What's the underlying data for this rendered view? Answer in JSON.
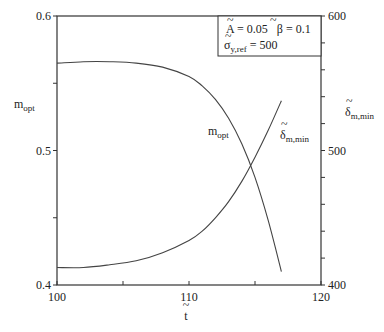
{
  "chart_data": {
    "type": "line",
    "title": "",
    "xlabel": "t̃",
    "ylabel_left": "m_opt",
    "ylabel_right": "δ̃_m,min",
    "xlim": [
      100,
      120
    ],
    "ylim_left": [
      0.4,
      0.6
    ],
    "ylim_right": [
      400,
      600
    ],
    "x_ticks": [
      "100",
      "110",
      "120"
    ],
    "y_ticks_left": [
      "0.4",
      "0.5",
      "0.6"
    ],
    "y_ticks_right": [
      "400",
      "500",
      "600"
    ],
    "grid": false,
    "legend_box": {
      "line1": "Ã = 0.05   β̃ = 0.1",
      "line2": "σ̃_y,ref = 500"
    },
    "series": [
      {
        "name": "m_opt",
        "axis": "left",
        "x": [
          100,
          102,
          104,
          106,
          108,
          110,
          111,
          112,
          113,
          114,
          115,
          116,
          117
        ],
        "values": [
          0.565,
          0.566,
          0.566,
          0.565,
          0.562,
          0.555,
          0.548,
          0.538,
          0.524,
          0.505,
          0.48,
          0.448,
          0.41
        ]
      },
      {
        "name": "δ̃_m,min",
        "axis": "right",
        "x": [
          100,
          102,
          104,
          106,
          108,
          110,
          111,
          112,
          113,
          114,
          115,
          116,
          117
        ],
        "values": [
          413,
          413,
          415,
          418,
          424,
          433,
          440,
          450,
          462,
          477,
          495,
          515,
          537
        ]
      }
    ]
  },
  "labels": {
    "x_axis": "t",
    "y_left_main": "m",
    "y_left_sub": "opt",
    "y_right_main": "δ",
    "y_right_sub": "m,min",
    "curve_mopt_main": "m",
    "curve_mopt_sub": "opt",
    "curve_delta_main": "δ",
    "curve_delta_sub": "m,min",
    "legend_A": "A = 0.05",
    "legend_B": "β = 0.1",
    "legend_sigma_main": "σ",
    "legend_sigma_sub": "y,ref",
    "legend_sigma_val": " = 500"
  }
}
